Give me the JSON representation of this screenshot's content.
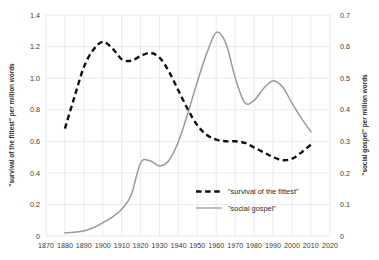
{
  "chart_data": {
    "type": "line",
    "title": "",
    "xlabel": "",
    "grid": true,
    "legend_position": "inside-lower-right",
    "x_ticks": [
      "1870",
      "1880",
      "1890",
      "1900",
      "1910",
      "1920",
      "1930",
      "1940",
      "1950",
      "1960",
      "1970",
      "1980",
      "1990",
      "2000",
      "2010",
      "2020"
    ],
    "xlim": [
      1870,
      2020
    ],
    "left_axis": {
      "label": "\"survival of the fittest\" per million words",
      "ticks": [
        "0",
        "0.2",
        "0.4",
        "0.6",
        "0.8",
        "1.0",
        "1.2",
        "1.4"
      ],
      "ylim": [
        0,
        1.4
      ]
    },
    "right_axis": {
      "label": "\"social gospel\" per million words",
      "ticks": [
        "0",
        "0.1",
        "0.2",
        "0.3",
        "0.4",
        "0.5",
        "0.6",
        "0.7"
      ],
      "ylim": [
        0,
        0.7
      ]
    },
    "series": [
      {
        "name": "\"survival of the fittest\"",
        "axis": "left",
        "style": "dashed",
        "color": "#111111",
        "x": [
          1880,
          1885,
          1890,
          1895,
          1900,
          1905,
          1910,
          1915,
          1920,
          1925,
          1930,
          1935,
          1940,
          1945,
          1950,
          1955,
          1960,
          1965,
          1970,
          1975,
          1980,
          1985,
          1990,
          1995,
          2000,
          2005,
          2010
        ],
        "values": [
          0.68,
          0.88,
          1.07,
          1.18,
          1.23,
          1.19,
          1.12,
          1.11,
          1.14,
          1.16,
          1.13,
          1.04,
          0.92,
          0.8,
          0.7,
          0.64,
          0.61,
          0.6,
          0.6,
          0.59,
          0.56,
          0.53,
          0.5,
          0.48,
          0.49,
          0.53,
          0.58
        ]
      },
      {
        "name": "\"social gospel\"",
        "axis": "right",
        "style": "solid",
        "color": "#9a9a9a",
        "x": [
          1880,
          1885,
          1890,
          1895,
          1900,
          1905,
          1910,
          1915,
          1920,
          1925,
          1930,
          1935,
          1940,
          1945,
          1950,
          1955,
          1960,
          1965,
          1970,
          1975,
          1980,
          1985,
          1990,
          1995,
          2000,
          2005,
          2010
        ],
        "values": [
          0.01,
          0.012,
          0.016,
          0.026,
          0.042,
          0.06,
          0.085,
          0.13,
          0.232,
          0.238,
          0.222,
          0.24,
          0.3,
          0.39,
          0.49,
          0.58,
          0.645,
          0.61,
          0.5,
          0.422,
          0.43,
          0.468,
          0.492,
          0.472,
          0.42,
          0.372,
          0.33
        ]
      }
    ],
    "legend": [
      {
        "label": "\"survival of the fittest\"",
        "style": "dashed",
        "color": "#111111"
      },
      {
        "label": "\"social gospel\"",
        "style": "solid",
        "color": "#9a9a9a"
      }
    ]
  }
}
